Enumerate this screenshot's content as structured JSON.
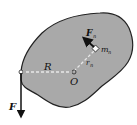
{
  "diagram": {
    "body_color": "#a8a8a8",
    "outline_color": "#222222",
    "labels": {
      "force_F": "F",
      "radius_R": "R",
      "origin_O": "O",
      "force_Fn": "F",
      "force_Fn_sub": "n",
      "mass_m": "m",
      "mass_m_sub": "n",
      "radius_r": "r",
      "radius_r_sub": "n"
    }
  }
}
